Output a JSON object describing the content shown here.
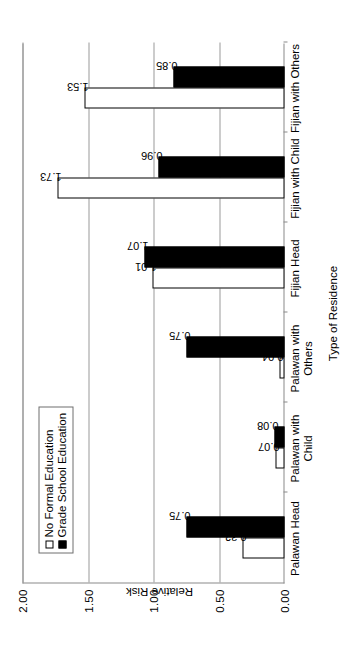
{
  "chart_data": {
    "type": "bar",
    "orientation": "vertical-grouped",
    "title": "",
    "xlabel": "Type of Residence",
    "ylabel": "Relative Risk",
    "ylim": [
      0.0,
      2.0
    ],
    "yticks": [
      "0.00",
      "0.50",
      "1.00",
      "1.50",
      "2.00"
    ],
    "ytick_values": [
      0.0,
      0.5,
      1.0,
      1.5,
      2.0
    ],
    "grid": true,
    "legend_position": "upper-left",
    "categories": [
      "Palawan Head",
      "Palawan with\nChild",
      "Palawan with\nOthers",
      "Fijian Head",
      "Fijian with Child",
      "Fijian with Others"
    ],
    "series": [
      {
        "name": "No Formal Education",
        "color": "#ffffff",
        "edge": "#000000",
        "values": [
          0.32,
          0.07,
          0.04,
          1.01,
          1.73,
          1.53
        ],
        "labels": [
          "0.32",
          "0.07",
          "0.04",
          "1.01",
          "1.73",
          "1.53"
        ]
      },
      {
        "name": "Grade School Education",
        "color": "#000000",
        "edge": "#000000",
        "values": [
          0.75,
          0.08,
          0.75,
          1.07,
          0.96,
          0.85
        ],
        "labels": [
          "0.75",
          "0.08",
          "0.75",
          "1.07",
          "0.96",
          "0.85"
        ]
      }
    ]
  },
  "legend": {
    "items": [
      {
        "label": "No Formal Education",
        "swatch": "white"
      },
      {
        "label": "Grade School Education",
        "swatch": "black"
      }
    ]
  },
  "axis": {
    "y_title": "Relative Risk",
    "x_title": "Type of Residence",
    "y_ticks": [
      "2.00",
      "1.50",
      "1.00",
      "0.50",
      "0.00"
    ]
  }
}
